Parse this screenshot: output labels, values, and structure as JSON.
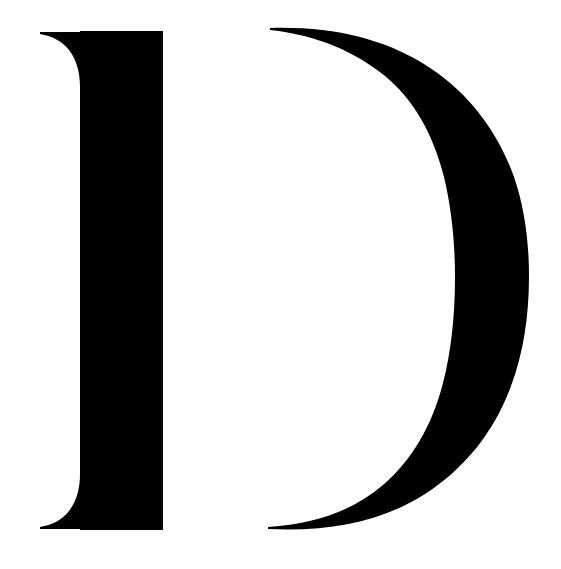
{
  "canvas": {
    "width": 561,
    "height": 569,
    "background_color": "#ffffff"
  },
  "glyph": {
    "character": "D",
    "name": "latin-capital-letter-d",
    "style": "didone-high-contrast-serif",
    "fill_color": "#000000",
    "description": "Large black serif capital letter D with a detached bowl",
    "bounding_box": {
      "left": 40,
      "top": 27,
      "right": 528,
      "bottom": 531
    },
    "parts": {
      "stem": {
        "name": "vertical-stem",
        "left": 80,
        "right": 163,
        "top": 31,
        "bottom": 530,
        "width": 83,
        "serif_tip_left": 40
      },
      "bowl": {
        "name": "detached-bowl",
        "top_taper_point_x": 270,
        "top_taper_point_y": 28,
        "bottom_taper_point_x": 268,
        "bottom_taper_point_y": 529,
        "outer_max_x": 527,
        "inner_min_x": 442,
        "vertical_center_y": 285,
        "max_thickness": 85
      }
    }
  }
}
